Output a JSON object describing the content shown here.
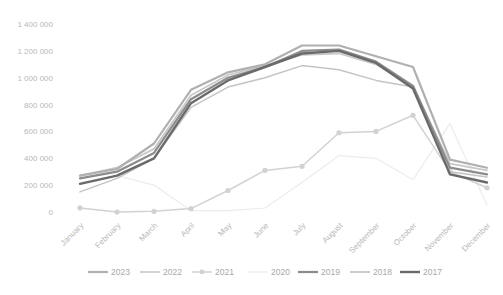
{
  "chart_data": {
    "type": "line",
    "title": "",
    "xlabel": "",
    "ylabel": "",
    "categories": [
      "January",
      "February",
      "March",
      "April",
      "May",
      "June",
      "July",
      "August",
      "September",
      "October",
      "November",
      "December"
    ],
    "yticks": [
      "0",
      "200 000",
      "400 000",
      "600 000",
      "800 000",
      "1 000 000",
      "1 200 000",
      "1 400 000"
    ],
    "ylim": [
      0,
      1400000
    ],
    "grid": false,
    "legend_position": "bottom",
    "series": [
      {
        "name": "2023",
        "color": "#b0b0b0",
        "width": 2.2,
        "marker": false,
        "values": [
          270000,
          320000,
          510000,
          910000,
          1040000,
          1100000,
          1240000,
          1240000,
          1160000,
          1080000,
          390000,
          330000
        ]
      },
      {
        "name": "2022",
        "color": "#c4c4c4",
        "width": 1.5,
        "marker": false,
        "values": [
          150000,
          250000,
          400000,
          780000,
          930000,
          1000000,
          1090000,
          1060000,
          980000,
          930000,
          300000,
          260000
        ]
      },
      {
        "name": "2021",
        "color": "#d2d2d2",
        "width": 1.5,
        "marker": true,
        "values": [
          30000,
          0,
          5000,
          25000,
          160000,
          310000,
          340000,
          590000,
          600000,
          720000,
          300000,
          180000
        ]
      },
      {
        "name": "2020",
        "color": "#ececec",
        "width": 1.2,
        "marker": false,
        "values": [
          220000,
          270000,
          200000,
          10000,
          10000,
          30000,
          220000,
          420000,
          400000,
          240000,
          660000,
          50000
        ]
      },
      {
        "name": "2019",
        "color": "#8c8c8c",
        "width": 2.2,
        "marker": false,
        "values": [
          250000,
          300000,
          440000,
          840000,
          1000000,
          1080000,
          1200000,
          1210000,
          1120000,
          940000,
          330000,
          280000
        ]
      },
      {
        "name": "2018",
        "color": "#c8c8c8",
        "width": 1.8,
        "marker": false,
        "values": [
          270000,
          330000,
          470000,
          870000,
          1020000,
          1090000,
          1170000,
          1180000,
          1100000,
          930000,
          360000,
          310000
        ]
      },
      {
        "name": "2017",
        "color": "#6a6a6a",
        "width": 2.4,
        "marker": false,
        "values": [
          210000,
          270000,
          400000,
          810000,
          980000,
          1080000,
          1180000,
          1200000,
          1110000,
          920000,
          280000,
          220000
        ]
      }
    ]
  }
}
